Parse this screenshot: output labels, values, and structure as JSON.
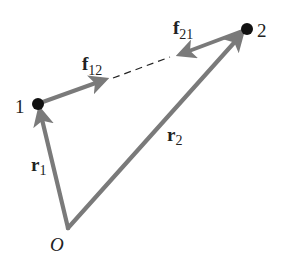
{
  "diagram": {
    "type": "vector-diagram",
    "colors": {
      "vector": "#7a7a7a",
      "point": "#111111",
      "text": "#222222",
      "dash": "#222222"
    },
    "origin": {
      "label": "O",
      "x": 68,
      "y": 228
    },
    "particles": [
      {
        "id": "1",
        "label": "1",
        "x": 38,
        "y": 104
      },
      {
        "id": "2",
        "label": "2",
        "x": 247,
        "y": 29
      }
    ],
    "vectors": {
      "r1": {
        "symbol": "r",
        "subscript": "1",
        "from": "O",
        "to": "1"
      },
      "r2": {
        "symbol": "r",
        "subscript": "2",
        "from": "O",
        "to": "2"
      },
      "f12": {
        "symbol": "f",
        "subscript": "12",
        "from": "1",
        "direction": "toward 2"
      },
      "f21": {
        "symbol": "f",
        "subscript": "21",
        "from": "2",
        "direction": "toward 1"
      }
    },
    "labels": {
      "point1": "1",
      "point2": "2",
      "origin": "O",
      "r1_symbol": "r",
      "r1_sub": "1",
      "r2_symbol": "r",
      "r2_sub": "2",
      "f12_symbol": "f",
      "f12_sub": "12",
      "f21_symbol": "f",
      "f21_sub": "21"
    }
  }
}
